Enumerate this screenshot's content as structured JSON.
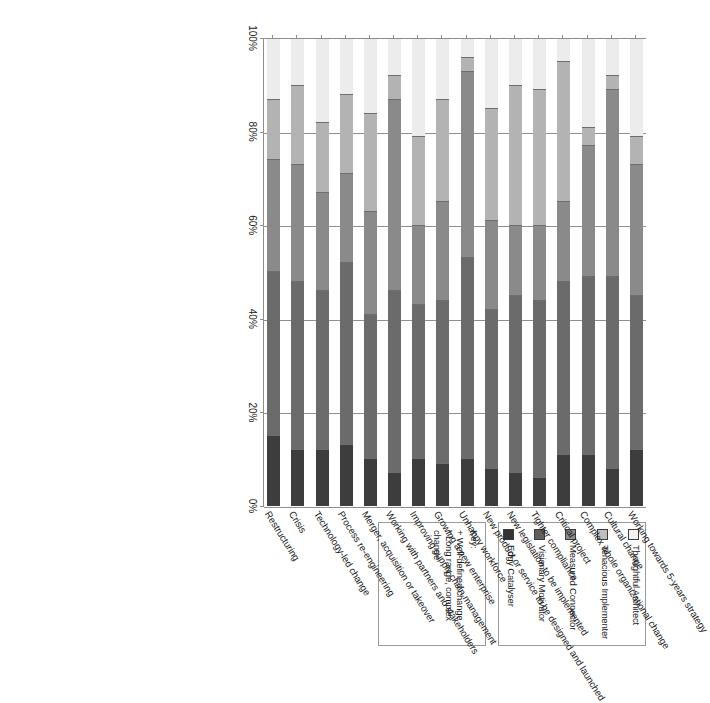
{
  "chart_data": {
    "type": "bar",
    "orientation": "horizontal-stacked",
    "title": "",
    "xlabel": "",
    "ylabel": "",
    "xlim": [
      0,
      100
    ],
    "axis_direction": "reversed",
    "grid": true,
    "tick_labels": [
      "100%",
      "80%",
      "60%",
      "40%",
      "20%",
      "0%"
    ],
    "tick_values": [
      100,
      80,
      60,
      40,
      20,
      0
    ],
    "categories": [
      "Working towards 5-years strategy",
      "Cultural change",
      "Complex whole organizational change",
      "Critical project",
      "Tighter compliance",
      "New legislation to be implemented",
      "New product or service to be designed and launched",
      "Unhappy workforce",
      "Growing a new enterprise",
      "Improving supply chain management",
      "Working with partners and stakeholders",
      "Merger, acquisition or takeover",
      "Process re-engineering",
      "Technology-led change",
      "Crisis",
      "Restructuring"
    ],
    "series": [
      {
        "name": "Thoughtful Architect",
        "color": "#ececec",
        "values": [
          21,
          8,
          19,
          5,
          11,
          10,
          15,
          4,
          13,
          21,
          8,
          16,
          12,
          18,
          10,
          13
        ]
      },
      {
        "name": "Tenacious Implementer",
        "color": "#b3b3b3",
        "values": [
          6,
          3,
          4,
          30,
          29,
          30,
          24,
          3,
          22,
          19,
          5,
          21,
          17,
          15,
          17,
          13
        ]
      },
      {
        "name": "Measured Connector",
        "color": "#8a8a8a",
        "values": [
          28,
          40,
          28,
          17,
          16,
          15,
          19,
          40,
          21,
          17,
          41,
          22,
          19,
          21,
          25,
          24
        ]
      },
      {
        "name": "Visionary Motivator",
        "color": "#6b6b6b",
        "values": [
          33,
          41,
          38,
          37,
          38,
          38,
          34,
          43,
          35,
          33,
          39,
          31,
          39,
          34,
          36,
          35
        ]
      },
      {
        "name": "Edgy Catalyser",
        "color": "#3d3d3d",
        "values": [
          12,
          8,
          11,
          11,
          6,
          7,
          8,
          10,
          9,
          10,
          7,
          10,
          13,
          12,
          12,
          15
        ]
      }
    ]
  },
  "legend": {
    "title": "",
    "items": [
      {
        "label": "Thoughtful Architect",
        "color": "#f2f2f2"
      },
      {
        "label": "Tenacious Implementer",
        "color": "#bfbfbf"
      },
      {
        "label": "Measured Connector",
        "color": "#8a8a8a"
      },
      {
        "label": "Visionary Motivator",
        "color": "#5f5f5f"
      },
      {
        "label": "Edgy Catalyser",
        "color": "#333333"
      }
    ]
  },
  "key": {
    "title": "Key:",
    "lines": [
      "+ Well-defined change",
      "* Long range, complex change"
    ]
  }
}
